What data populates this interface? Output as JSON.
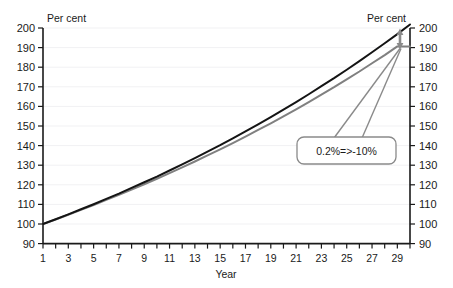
{
  "chart_data": {
    "type": "line",
    "title": "",
    "xlabel": "Year",
    "ylabel_left": "Per cent",
    "ylabel_right": "Per cent",
    "xlim": [
      1,
      30
    ],
    "ylim": [
      90,
      200
    ],
    "ytick_step": 10,
    "xtick_step_major": 2,
    "xtick_step_minor": 1,
    "grid": true,
    "grid_axis": "y",
    "legend": "none",
    "yticks": [
      200,
      190,
      180,
      170,
      160,
      150,
      140,
      130,
      120,
      110,
      100,
      90
    ],
    "yticks_right": [
      200,
      190,
      180,
      170,
      160,
      150,
      140,
      130,
      120,
      110,
      100,
      90
    ],
    "xticks": [
      1,
      3,
      5,
      7,
      9,
      11,
      13,
      15,
      17,
      19,
      21,
      23,
      25,
      27,
      29
    ],
    "x": [
      1,
      2,
      3,
      4,
      5,
      6,
      7,
      8,
      9,
      10,
      11,
      12,
      13,
      14,
      15,
      16,
      17,
      18,
      19,
      20,
      21,
      22,
      23,
      24,
      25,
      26,
      27,
      28,
      29,
      30
    ],
    "series": [
      {
        "name": "baseline",
        "color": "#141414",
        "width": 2.0,
        "values": [
          100.0,
          102.4,
          104.9,
          107.5,
          110.1,
          112.8,
          115.5,
          118.4,
          121.3,
          124.2,
          127.3,
          130.4,
          133.6,
          136.9,
          140.2,
          143.7,
          147.2,
          150.8,
          154.5,
          158.3,
          162.2,
          166.2,
          170.3,
          174.4,
          178.7,
          183.1,
          187.6,
          192.2,
          196.9,
          201.8
        ]
      },
      {
        "name": "reduced",
        "color": "#808080",
        "width": 2.0,
        "values": [
          100.0,
          102.3,
          104.7,
          107.2,
          109.7,
          112.3,
          114.9,
          117.6,
          120.3,
          123.1,
          126.0,
          128.9,
          131.9,
          135.0,
          138.1,
          141.3,
          144.6,
          148.0,
          151.4,
          154.9,
          158.5,
          162.2,
          166.0,
          169.8,
          173.8,
          177.8,
          182.0,
          186.2,
          190.6,
          190.5
        ]
      }
    ],
    "annotations": [
      {
        "name": "callout",
        "text": "0.2%=>-10%",
        "color": "#7f7f7f"
      },
      {
        "name": "gap-arrow",
        "description": "double-headed vertical arrow between curve endpoints",
        "color": "#8a8a8a",
        "from_value": 200,
        "to_value": 190
      }
    ],
    "colors": {
      "series_black": "#141414",
      "series_gray": "#808080",
      "axis": "#1a1a1a",
      "grid": "#f2f2f4",
      "callout_border": "#808080",
      "arrow": "#8a8a8a",
      "background": "#ffffff"
    }
  }
}
